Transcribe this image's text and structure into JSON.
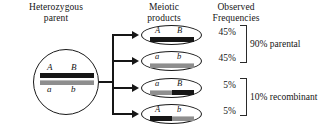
{
  "headers": {
    "parent": "Heterozygous\nparent",
    "products": "Meiotic\nproducts",
    "frequencies": "Observed\nFrequencies"
  },
  "parent_cell": {
    "top_allele_left": "A",
    "top_allele_right": "B",
    "bottom_allele_left": "a",
    "bottom_allele_right": "b",
    "top_chromatid_color": "#161616",
    "bottom_chromatid_color": "#8e8e8e"
  },
  "products": [
    {
      "allele_left": "A",
      "allele_right": "B",
      "left_segment_color": "#161616",
      "right_segment_color": "#161616",
      "frequency": "45%"
    },
    {
      "allele_left": "a",
      "allele_right": "b",
      "left_segment_color": "#8e8e8e",
      "right_segment_color": "#8e8e8e",
      "frequency": "45%"
    },
    {
      "allele_left": "a",
      "allele_right": "B",
      "left_segment_color": "#8e8e8e",
      "right_segment_color": "#161616",
      "frequency": "5%"
    },
    {
      "allele_left": "A",
      "allele_right": "b",
      "left_segment_color": "#161616",
      "right_segment_color": "#8e8e8e",
      "frequency": "5%"
    }
  ],
  "groups": {
    "parental": "90% parental",
    "recombinant": "10% recombinant"
  }
}
